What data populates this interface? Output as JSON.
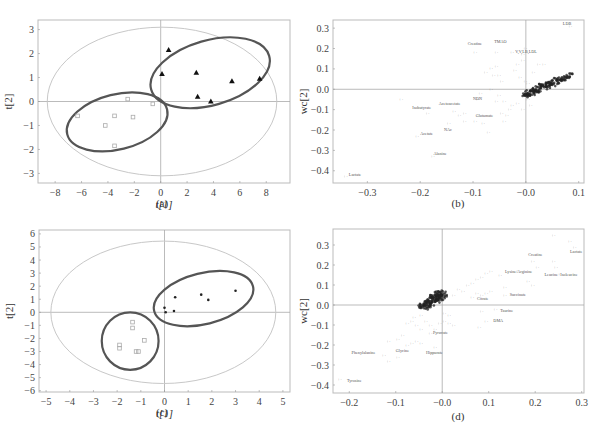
{
  "chart_data": [
    {
      "id": "a",
      "type": "scatter",
      "caption": "(a)",
      "title": "",
      "xlabel": "t[1]",
      "ylabel": "t[2]",
      "xlim": [
        -9.3,
        9.8
      ],
      "ylim": [
        -3.4,
        3.4
      ],
      "xticks": [
        -8,
        -6,
        -4,
        -2,
        0,
        2,
        4,
        6,
        8
      ],
      "yticks": [
        -3,
        -2,
        -1,
        0,
        1,
        2,
        3
      ],
      "frame": {
        "x0": 38,
        "x1": 290,
        "y0": 20,
        "y1": 183
      },
      "hotelling_ellipse": {
        "cx": 0.1,
        "cy": 0,
        "rx": 8.7,
        "ry": 3.1
      },
      "group_ellipses": [
        {
          "cx": -3.3,
          "cy": -0.85,
          "rx": 3.9,
          "ry": 1.15,
          "angle": -14
        },
        {
          "cx": 3.75,
          "cy": 1.2,
          "rx": 4.65,
          "ry": 1.35,
          "angle": -16
        }
      ],
      "series": [
        {
          "name": "control",
          "marker": "open-square",
          "points": [
            [
              -6.3,
              -0.6
            ],
            [
              -4.2,
              -1.0
            ],
            [
              -3.5,
              -0.6
            ],
            [
              -3.5,
              -1.85
            ],
            [
              -2.5,
              0.1
            ],
            [
              -2.1,
              -0.65
            ],
            [
              -0.6,
              -0.1
            ]
          ]
        },
        {
          "name": "treated",
          "marker": "filled-triangle",
          "points": [
            [
              0.1,
              1.15
            ],
            [
              0.6,
              2.15
            ],
            [
              2.7,
              1.2
            ],
            [
              2.8,
              0.2
            ],
            [
              3.8,
              0.0
            ],
            [
              5.4,
              0.85
            ],
            [
              7.5,
              0.95
            ]
          ]
        }
      ]
    },
    {
      "id": "b",
      "type": "scatter",
      "caption": "(b)",
      "title": "",
      "xlabel": "",
      "ylabel": "wc[2]",
      "xlim": [
        -0.365,
        0.11
      ],
      "ylim": [
        -0.46,
        0.34
      ],
      "xticks": [
        -0.3,
        -0.2,
        -0.1,
        -0.0,
        0.1
      ],
      "xtick_labels": [
        "-0.3",
        "-0.2",
        "-0.1",
        "-0.0",
        "0.1"
      ],
      "yticks": [
        -0.4,
        -0.3,
        -0.2,
        -0.1,
        0.0,
        0.1,
        0.2,
        0.3
      ],
      "ytick_labels": [
        "-0.4",
        "-0.3",
        "-0.2",
        "-0.1",
        "0.0",
        "0.1",
        "0.2",
        "0.3"
      ],
      "frame": {
        "x0": 333,
        "x1": 584,
        "y0": 20,
        "y1": 183
      },
      "cluster": {
        "from": [
          0.0,
          -0.03
        ],
        "to": [
          0.08,
          0.07
        ],
        "count": 160,
        "spread": 0.012
      },
      "scatter_points": [
        [
          -0.24,
          -0.05
        ],
        [
          -0.19,
          -0.12
        ],
        [
          -0.21,
          -0.23
        ],
        [
          -0.18,
          -0.33
        ],
        [
          -0.14,
          -0.11
        ],
        [
          -0.15,
          -0.17
        ],
        [
          -0.12,
          -0.16
        ],
        [
          -0.1,
          -0.16
        ],
        [
          -0.095,
          -0.05
        ],
        [
          -0.09,
          -0.02
        ],
        [
          -0.085,
          -0.17
        ],
        [
          -0.075,
          -0.21
        ],
        [
          -0.08,
          0.08
        ],
        [
          -0.07,
          0.1
        ],
        [
          -0.065,
          0.07
        ],
        [
          -0.06,
          0.11
        ],
        [
          -0.055,
          0.07
        ],
        [
          -0.05,
          0.04
        ],
        [
          -0.06,
          -0.06
        ],
        [
          -0.05,
          -0.12
        ],
        [
          -0.045,
          -0.16
        ],
        [
          -0.04,
          -0.13
        ],
        [
          -0.035,
          -0.1
        ],
        [
          -0.03,
          -0.08
        ],
        [
          -0.02,
          0.12
        ],
        [
          -0.025,
          0.09
        ],
        [
          -0.015,
          0.06
        ],
        [
          -0.01,
          0.17
        ],
        [
          -0.005,
          0.2
        ],
        [
          -0.01,
          0.14
        ],
        [
          -0.005,
          0.04
        ],
        [
          0.0,
          0.03
        ],
        [
          0.005,
          -0.02
        ],
        [
          -0.03,
          0.18
        ],
        [
          -0.06,
          0.18
        ],
        [
          -0.1,
          0.18
        ],
        [
          0.02,
          0.12
        ],
        [
          0.03,
          0.12
        ],
        [
          0.01,
          0.08
        ],
        [
          0.0,
          -0.05
        ],
        [
          -0.01,
          -0.1
        ],
        [
          0.005,
          -0.08
        ],
        [
          -0.12,
          -0.12
        ],
        [
          -0.13,
          -0.13
        ],
        [
          -0.345,
          -0.43
        ],
        [
          0.08,
          0.31
        ],
        [
          -0.07,
          0.0
        ],
        [
          -0.055,
          -0.03
        ],
        [
          -0.045,
          -0.06
        ],
        [
          -0.02,
          -0.07
        ]
      ],
      "annotations": [
        {
          "text": "Creatine",
          "x": -0.11,
          "y": 0.215
        },
        {
          "text": "TMAO",
          "x": -0.06,
          "y": 0.225
        },
        {
          "text": "V,V,LB,LDL",
          "x": -0.02,
          "y": 0.18
        },
        {
          "text": "LDB",
          "x": 0.07,
          "y": 0.315
        },
        {
          "text": "Isobutyrate",
          "x": -0.215,
          "y": -0.095
        },
        {
          "text": "Acetoacetate",
          "x": -0.165,
          "y": -0.075
        },
        {
          "text": "NDN",
          "x": -0.1,
          "y": -0.055
        },
        {
          "text": "Glutamate",
          "x": -0.095,
          "y": -0.135
        },
        {
          "text": "NAc",
          "x": -0.155,
          "y": -0.205
        },
        {
          "text": "Acetate",
          "x": -0.2,
          "y": -0.225
        },
        {
          "text": "Alanine",
          "x": -0.175,
          "y": -0.325
        },
        {
          "text": "Lactate",
          "x": -0.335,
          "y": -0.425
        }
      ]
    },
    {
      "id": "c",
      "type": "scatter",
      "caption": "(c)",
      "title": "",
      "xlabel": "t[1]",
      "ylabel": "t[2]",
      "xlim": [
        -5.3,
        5.3
      ],
      "ylim": [
        -6.1,
        6.3
      ],
      "xticks": [
        -5,
        -4,
        -3,
        -2,
        -1,
        0,
        1,
        2,
        3,
        4,
        5
      ],
      "yticks": [
        -6,
        -5,
        -4,
        -3,
        -2,
        -1,
        0,
        1,
        2,
        3,
        4,
        5,
        6
      ],
      "frame": {
        "x0": 39,
        "x1": 290,
        "y0": 230,
        "y1": 392
      },
      "hotelling_ellipse": {
        "cx": -0.05,
        "cy": 0,
        "rx": 4.75,
        "ry": 5.45
      },
      "group_ellipses": [
        {
          "cx": -1.45,
          "cy": -2.2,
          "rx": 1.2,
          "ry": 2.2,
          "angle": 0
        },
        {
          "cx": 1.65,
          "cy": 1.05,
          "rx": 2.15,
          "ry": 1.95,
          "angle": -14
        }
      ],
      "series": [
        {
          "name": "control",
          "marker": "open-square",
          "points": [
            [
              -1.35,
              -0.75
            ],
            [
              -1.35,
              -1.2
            ],
            [
              -0.85,
              -2.15
            ],
            [
              -1.9,
              -2.5
            ],
            [
              -1.9,
              -2.75
            ],
            [
              -1.2,
              -3.0
            ],
            [
              -1.1,
              -3.0
            ]
          ]
        },
        {
          "name": "treated",
          "marker": "filled-dot",
          "points": [
            [
              0.0,
              0.35
            ],
            [
              0.05,
              0.0
            ],
            [
              0.45,
              1.15
            ],
            [
              0.4,
              0.1
            ],
            [
              1.55,
              1.35
            ],
            [
              1.85,
              0.95
            ],
            [
              3.0,
              1.65
            ]
          ]
        }
      ]
    },
    {
      "id": "d",
      "type": "scatter",
      "caption": "(d)",
      "title": "",
      "xlabel": "",
      "ylabel": "wc[2]",
      "xlim": [
        -0.235,
        0.305
      ],
      "ylim": [
        -0.44,
        0.38
      ],
      "xticks": [
        -0.2,
        -0.1,
        -0.0,
        0.1,
        0.2,
        0.3
      ],
      "xtick_labels": [
        "-0.2",
        "-0.1",
        "-0.0",
        "0.1",
        "0.2",
        "0.3"
      ],
      "yticks": [
        -0.4,
        -0.3,
        -0.2,
        -0.1,
        0.0,
        0.1,
        0.2,
        0.3
      ],
      "ytick_labels": [
        "-0.4",
        "-0.3",
        "-0.2",
        "-0.1",
        "0.0",
        "0.1",
        "0.2",
        "0.3"
      ],
      "frame": {
        "x0": 333,
        "x1": 584,
        "y0": 229,
        "y1": 393
      },
      "cluster": {
        "from": [
          -0.04,
          -0.01
        ],
        "to": [
          0.0,
          0.06
        ],
        "count": 150,
        "spread": 0.014
      },
      "scatter_points": [
        [
          -0.12,
          -0.18
        ],
        [
          -0.1,
          -0.17
        ],
        [
          -0.09,
          -0.15
        ],
        [
          -0.08,
          -0.2
        ],
        [
          -0.07,
          -0.19
        ],
        [
          -0.06,
          -0.18
        ],
        [
          -0.05,
          -0.19
        ],
        [
          -0.05,
          -0.12
        ],
        [
          -0.06,
          -0.1
        ],
        [
          -0.07,
          -0.08
        ],
        [
          -0.08,
          -0.09
        ],
        [
          -0.065,
          -0.06
        ],
        [
          -0.05,
          -0.05
        ],
        [
          -0.04,
          -0.08
        ],
        [
          -0.03,
          -0.1
        ],
        [
          -0.02,
          -0.12
        ],
        [
          -0.01,
          -0.09
        ],
        [
          0.0,
          -0.08
        ],
        [
          0.01,
          -0.09
        ],
        [
          0.02,
          -0.1
        ],
        [
          -0.03,
          -0.14
        ],
        [
          -0.02,
          -0.21
        ],
        [
          -0.1,
          -0.26
        ],
        [
          -0.12,
          -0.28
        ],
        [
          -0.13,
          -0.25
        ],
        [
          -0.225,
          -0.37
        ],
        [
          0.0,
          -0.04
        ],
        [
          0.01,
          -0.05
        ],
        [
          0.02,
          0.05
        ],
        [
          0.03,
          0.08
        ],
        [
          0.04,
          0.07
        ],
        [
          0.05,
          0.1
        ],
        [
          0.06,
          0.11
        ],
        [
          0.07,
          0.13
        ],
        [
          0.08,
          0.14
        ],
        [
          0.09,
          0.16
        ],
        [
          0.1,
          0.17
        ],
        [
          0.12,
          0.15
        ],
        [
          0.06,
          0.04
        ],
        [
          0.07,
          0.06
        ],
        [
          0.08,
          0.05
        ],
        [
          0.09,
          0.06
        ],
        [
          0.1,
          0.07
        ],
        [
          0.13,
          0.09
        ],
        [
          0.18,
          0.12
        ],
        [
          0.19,
          0.1
        ],
        [
          0.13,
          0.05
        ],
        [
          0.11,
          -0.02
        ],
        [
          0.08,
          -0.03
        ],
        [
          0.09,
          -0.08
        ],
        [
          0.075,
          -0.11
        ],
        [
          0.19,
          0.22
        ],
        [
          0.2,
          0.19
        ],
        [
          0.235,
          0.22
        ],
        [
          0.24,
          0.19
        ],
        [
          0.235,
          0.35
        ],
        [
          0.27,
          0.32
        ],
        [
          0.28,
          0.29
        ]
      ],
      "annotations": [
        {
          "text": "Creatine",
          "x": 0.185,
          "y": 0.245
        },
        {
          "text": "Lactate",
          "x": 0.275,
          "y": 0.26
        },
        {
          "text": "Leucine+Isoleucine",
          "x": 0.22,
          "y": 0.145
        },
        {
          "text": "Lysine/Arginine",
          "x": 0.135,
          "y": 0.16
        },
        {
          "text": "Citrate",
          "x": 0.075,
          "y": 0.025
        },
        {
          "text": "Succinate",
          "x": 0.145,
          "y": 0.045
        },
        {
          "text": "Taurine",
          "x": 0.125,
          "y": -0.035
        },
        {
          "text": "DMA",
          "x": 0.11,
          "y": -0.085
        },
        {
          "text": "Pyruvate",
          "x": -0.02,
          "y": -0.145
        },
        {
          "text": "Hippurate",
          "x": -0.035,
          "y": -0.245
        },
        {
          "text": "Glycine",
          "x": -0.1,
          "y": -0.235
        },
        {
          "text": "Phenylalanine",
          "x": -0.195,
          "y": -0.245
        },
        {
          "text": "Tyrosine",
          "x": -0.205,
          "y": -0.385
        }
      ]
    }
  ]
}
